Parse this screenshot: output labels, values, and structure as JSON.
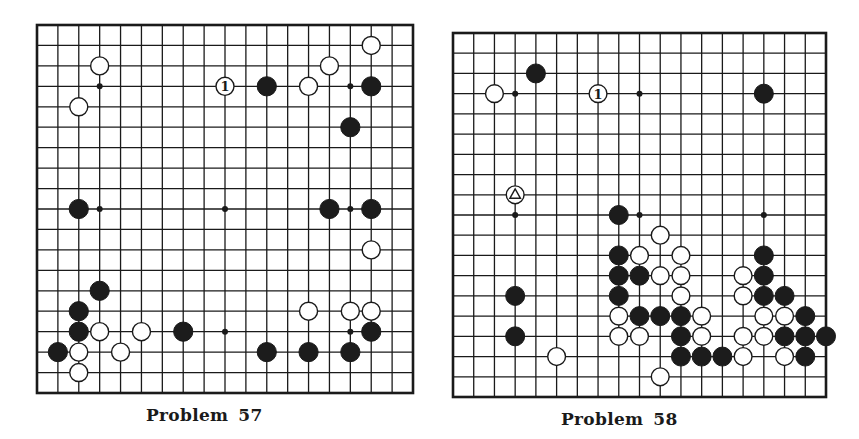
{
  "colors": {
    "paper": "#ffffff",
    "ink": "#1a1a1a",
    "black_stone": "#1c1c1c",
    "white_stone": "#ffffff"
  },
  "problems": [
    {
      "id": "problem-57",
      "caption_word": "Problem",
      "caption_number": "57",
      "frame": {
        "left": 37,
        "top": 25,
        "right": 413,
        "bottom": 393
      },
      "cells": 18,
      "stones": [
        {
          "c": "W",
          "x": 3,
          "y": 2
        },
        {
          "c": "W",
          "x": 2,
          "y": 4
        },
        {
          "c": "W",
          "x": 9,
          "y": 3,
          "label": "1"
        },
        {
          "c": "B",
          "x": 11,
          "y": 3
        },
        {
          "c": "W",
          "x": 13,
          "y": 3
        },
        {
          "c": "W",
          "x": 14,
          "y": 2
        },
        {
          "c": "W",
          "x": 16,
          "y": 1
        },
        {
          "c": "B",
          "x": 16,
          "y": 3
        },
        {
          "c": "B",
          "x": 15,
          "y": 5
        },
        {
          "c": "B",
          "x": 2,
          "y": 9
        },
        {
          "c": "B",
          "x": 14,
          "y": 9
        },
        {
          "c": "B",
          "x": 16,
          "y": 9
        },
        {
          "c": "W",
          "x": 16,
          "y": 11
        },
        {
          "c": "B",
          "x": 3,
          "y": 13
        },
        {
          "c": "B",
          "x": 2,
          "y": 14
        },
        {
          "c": "W",
          "x": 13,
          "y": 14
        },
        {
          "c": "W",
          "x": 15,
          "y": 14
        },
        {
          "c": "W",
          "x": 16,
          "y": 14
        },
        {
          "c": "B",
          "x": 2,
          "y": 15
        },
        {
          "c": "W",
          "x": 3,
          "y": 15
        },
        {
          "c": "W",
          "x": 5,
          "y": 15
        },
        {
          "c": "B",
          "x": 7,
          "y": 15
        },
        {
          "c": "B",
          "x": 16,
          "y": 15
        },
        {
          "c": "B",
          "x": 1,
          "y": 16
        },
        {
          "c": "W",
          "x": 2,
          "y": 16
        },
        {
          "c": "W",
          "x": 4,
          "y": 16
        },
        {
          "c": "B",
          "x": 11,
          "y": 16
        },
        {
          "c": "B",
          "x": 13,
          "y": 16
        },
        {
          "c": "B",
          "x": 15,
          "y": 16
        },
        {
          "c": "W",
          "x": 2,
          "y": 17
        }
      ],
      "hoshi": [
        {
          "x": 3,
          "y": 3
        },
        {
          "x": 15,
          "y": 3
        },
        {
          "x": 3,
          "y": 9
        },
        {
          "x": 9,
          "y": 9
        },
        {
          "x": 15,
          "y": 9
        },
        {
          "x": 9,
          "y": 15
        },
        {
          "x": 15,
          "y": 15
        }
      ]
    },
    {
      "id": "problem-58",
      "caption_word": "Problem",
      "caption_number": "58",
      "frame": {
        "left": 453,
        "top": 33,
        "right": 826,
        "bottom": 397
      },
      "cells": 18,
      "stones": [
        {
          "c": "B",
          "x": 4,
          "y": 2
        },
        {
          "c": "W",
          "x": 2,
          "y": 3
        },
        {
          "c": "W",
          "x": 7,
          "y": 3,
          "label": "1"
        },
        {
          "c": "B",
          "x": 15,
          "y": 3
        },
        {
          "c": "W",
          "x": 3,
          "y": 8,
          "mark": "triangle"
        },
        {
          "c": "B",
          "x": 8,
          "y": 9
        },
        {
          "c": "W",
          "x": 10,
          "y": 10
        },
        {
          "c": "B",
          "x": 8,
          "y": 11
        },
        {
          "c": "W",
          "x": 9,
          "y": 11
        },
        {
          "c": "W",
          "x": 11,
          "y": 11
        },
        {
          "c": "B",
          "x": 15,
          "y": 11
        },
        {
          "c": "B",
          "x": 8,
          "y": 12
        },
        {
          "c": "B",
          "x": 9,
          "y": 12
        },
        {
          "c": "W",
          "x": 10,
          "y": 12
        },
        {
          "c": "W",
          "x": 11,
          "y": 12
        },
        {
          "c": "W",
          "x": 14,
          "y": 12
        },
        {
          "c": "B",
          "x": 15,
          "y": 12
        },
        {
          "c": "B",
          "x": 3,
          "y": 13
        },
        {
          "c": "B",
          "x": 8,
          "y": 13
        },
        {
          "c": "W",
          "x": 11,
          "y": 13
        },
        {
          "c": "W",
          "x": 14,
          "y": 13
        },
        {
          "c": "B",
          "x": 15,
          "y": 13
        },
        {
          "c": "B",
          "x": 16,
          "y": 13
        },
        {
          "c": "W",
          "x": 8,
          "y": 14
        },
        {
          "c": "B",
          "x": 9,
          "y": 14
        },
        {
          "c": "B",
          "x": 10,
          "y": 14
        },
        {
          "c": "B",
          "x": 11,
          "y": 14
        },
        {
          "c": "W",
          "x": 12,
          "y": 14
        },
        {
          "c": "W",
          "x": 15,
          "y": 14
        },
        {
          "c": "W",
          "x": 16,
          "y": 14
        },
        {
          "c": "B",
          "x": 17,
          "y": 14
        },
        {
          "c": "B",
          "x": 3,
          "y": 15
        },
        {
          "c": "W",
          "x": 8,
          "y": 15
        },
        {
          "c": "W",
          "x": 9,
          "y": 15
        },
        {
          "c": "B",
          "x": 11,
          "y": 15
        },
        {
          "c": "W",
          "x": 12,
          "y": 15
        },
        {
          "c": "W",
          "x": 14,
          "y": 15
        },
        {
          "c": "W",
          "x": 15,
          "y": 15
        },
        {
          "c": "B",
          "x": 16,
          "y": 15
        },
        {
          "c": "B",
          "x": 17,
          "y": 15
        },
        {
          "c": "B",
          "x": 18,
          "y": 15
        },
        {
          "c": "W",
          "x": 5,
          "y": 16
        },
        {
          "c": "B",
          "x": 11,
          "y": 16
        },
        {
          "c": "B",
          "x": 12,
          "y": 16
        },
        {
          "c": "B",
          "x": 13,
          "y": 16
        },
        {
          "c": "W",
          "x": 14,
          "y": 16
        },
        {
          "c": "W",
          "x": 16,
          "y": 16
        },
        {
          "c": "B",
          "x": 17,
          "y": 16
        },
        {
          "c": "W",
          "x": 10,
          "y": 17
        }
      ],
      "hoshi": [
        {
          "x": 3,
          "y": 3
        },
        {
          "x": 9,
          "y": 3
        },
        {
          "x": 3,
          "y": 9
        },
        {
          "x": 9,
          "y": 9
        },
        {
          "x": 15,
          "y": 9
        }
      ]
    }
  ]
}
